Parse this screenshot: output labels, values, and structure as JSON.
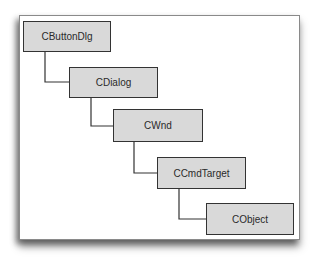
{
  "diagram": {
    "type": "class-hierarchy",
    "nodes": [
      {
        "id": "cbuttondlg",
        "label": "CButtonDlg"
      },
      {
        "id": "cdialog",
        "label": "CDialog"
      },
      {
        "id": "cwnd",
        "label": "CWnd"
      },
      {
        "id": "ccmdtarget",
        "label": "CCmdTarget"
      },
      {
        "id": "cobject",
        "label": "CObject"
      }
    ],
    "edges": [
      {
        "from": "cbuttondlg",
        "to": "cdialog"
      },
      {
        "from": "cdialog",
        "to": "cwnd"
      },
      {
        "from": "cwnd",
        "to": "ccmdtarget"
      },
      {
        "from": "ccmdtarget",
        "to": "cobject"
      }
    ],
    "colors": {
      "node_fill": "#d9d9d9",
      "node_border": "#333333",
      "connector": "#333333",
      "frame_border": "#8a8a8a"
    }
  }
}
